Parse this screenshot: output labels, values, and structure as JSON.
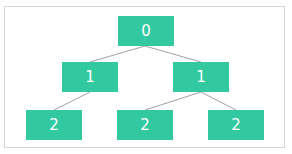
{
  "diagram": {
    "type": "tree",
    "colors": {
      "node_fill": "#33c9a0",
      "node_text": "#ffffff",
      "edge": "#888888",
      "frame_border": "#d6d6d6"
    },
    "nodes": [
      {
        "id": "root",
        "label": "0",
        "level": 0
      },
      {
        "id": "l1a",
        "label": "1",
        "level": 1
      },
      {
        "id": "l1b",
        "label": "1",
        "level": 1
      },
      {
        "id": "l2a",
        "label": "2",
        "level": 2
      },
      {
        "id": "l2b",
        "label": "2",
        "level": 2
      },
      {
        "id": "l2c",
        "label": "2",
        "level": 2
      }
    ],
    "edges": [
      [
        "root",
        "l1a"
      ],
      [
        "root",
        "l1b"
      ],
      [
        "l1a",
        "l2a"
      ],
      [
        "l1b",
        "l2b"
      ],
      [
        "l1b",
        "l2c"
      ]
    ]
  }
}
